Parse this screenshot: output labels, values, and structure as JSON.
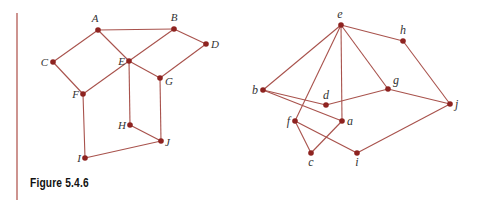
{
  "figure": {
    "caption": "Figure 5.4.6",
    "colors": {
      "edge": "#a8524c",
      "node": "#8e2320",
      "rule": "#b25a54"
    }
  },
  "left_graph": {
    "nodes": [
      {
        "id": "A",
        "x": 98,
        "y": 30,
        "lx": 95,
        "ly": 22,
        "anchor": "middle"
      },
      {
        "id": "B",
        "x": 174,
        "y": 29,
        "lx": 174,
        "ly": 21,
        "anchor": "middle"
      },
      {
        "id": "C",
        "x": 53,
        "y": 62,
        "lx": 48,
        "ly": 66,
        "anchor": "end"
      },
      {
        "id": "D",
        "x": 206,
        "y": 44,
        "lx": 211,
        "ly": 48,
        "anchor": "start"
      },
      {
        "id": "E",
        "x": 129,
        "y": 61,
        "lx": 125,
        "ly": 65,
        "anchor": "end"
      },
      {
        "id": "F",
        "x": 83,
        "y": 94,
        "lx": 79,
        "ly": 98,
        "anchor": "end"
      },
      {
        "id": "G",
        "x": 160,
        "y": 78,
        "lx": 165,
        "ly": 85,
        "anchor": "start"
      },
      {
        "id": "H",
        "x": 130,
        "y": 125,
        "lx": 126,
        "ly": 129,
        "anchor": "end"
      },
      {
        "id": "I",
        "x": 85,
        "y": 158,
        "lx": 81,
        "ly": 162,
        "anchor": "end"
      },
      {
        "id": "J",
        "x": 161,
        "y": 141,
        "lx": 165,
        "ly": 146,
        "anchor": "start"
      }
    ],
    "edges": [
      [
        "A",
        "B"
      ],
      [
        "A",
        "C"
      ],
      [
        "A",
        "E"
      ],
      [
        "B",
        "E"
      ],
      [
        "B",
        "D"
      ],
      [
        "D",
        "G"
      ],
      [
        "E",
        "G"
      ],
      [
        "C",
        "F"
      ],
      [
        "E",
        "F"
      ],
      [
        "E",
        "H"
      ],
      [
        "G",
        "J"
      ],
      [
        "H",
        "J"
      ],
      [
        "F",
        "I"
      ],
      [
        "I",
        "J"
      ]
    ]
  },
  "right_graph": {
    "nodes": [
      {
        "id": "a",
        "x": 342,
        "y": 121,
        "lx": 347,
        "ly": 125,
        "anchor": "start"
      },
      {
        "id": "b",
        "x": 263,
        "y": 90,
        "lx": 258,
        "ly": 94,
        "anchor": "end"
      },
      {
        "id": "c",
        "x": 311,
        "y": 153,
        "lx": 311,
        "ly": 166,
        "anchor": "middle"
      },
      {
        "id": "d",
        "x": 326,
        "y": 105,
        "lx": 326,
        "ly": 99,
        "anchor": "middle"
      },
      {
        "id": "e",
        "x": 341,
        "y": 25,
        "lx": 340,
        "ly": 18,
        "anchor": "middle"
      },
      {
        "id": "f",
        "x": 295,
        "y": 121,
        "lx": 290,
        "ly": 125,
        "anchor": "end"
      },
      {
        "id": "g",
        "x": 388,
        "y": 89,
        "lx": 393,
        "ly": 84,
        "anchor": "start"
      },
      {
        "id": "h",
        "x": 403,
        "y": 41,
        "lx": 403,
        "ly": 34,
        "anchor": "middle"
      },
      {
        "id": "i",
        "x": 357,
        "y": 153,
        "lx": 357,
        "ly": 166,
        "anchor": "middle"
      },
      {
        "id": "j",
        "x": 450,
        "y": 104,
        "lx": 455,
        "ly": 108,
        "anchor": "start"
      }
    ],
    "edges": [
      [
        "e",
        "b"
      ],
      [
        "e",
        "f"
      ],
      [
        "e",
        "a"
      ],
      [
        "e",
        "g"
      ],
      [
        "e",
        "h"
      ],
      [
        "h",
        "j"
      ],
      [
        "b",
        "d"
      ],
      [
        "b",
        "a"
      ],
      [
        "d",
        "g"
      ],
      [
        "g",
        "j"
      ],
      [
        "f",
        "c"
      ],
      [
        "f",
        "i"
      ],
      [
        "a",
        "c"
      ],
      [
        "i",
        "j"
      ]
    ]
  }
}
